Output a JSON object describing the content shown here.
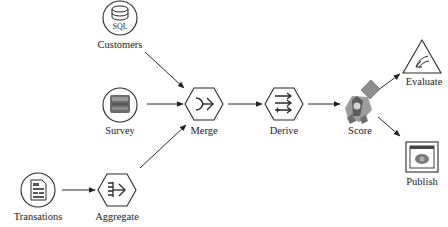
{
  "diagram": {
    "type": "data-flow",
    "nodes": [
      {
        "id": "customers",
        "label": "Customers",
        "shape": "circle",
        "icon": "database-sql-icon",
        "icon_text": "SQL"
      },
      {
        "id": "survey",
        "label": "Survey",
        "shape": "circle",
        "icon": "survey-form-icon"
      },
      {
        "id": "transations",
        "label": "Transations",
        "shape": "circle",
        "icon": "document-icon"
      },
      {
        "id": "aggregate",
        "label": "Aggregate",
        "shape": "hexagon",
        "icon": "aggregate-arrows-icon"
      },
      {
        "id": "merge",
        "label": "Merge",
        "shape": "hexagon",
        "icon": "merge-arrow-icon"
      },
      {
        "id": "derive",
        "label": "Derive",
        "shape": "hexagon",
        "icon": "derive-arrows-icon"
      },
      {
        "id": "score",
        "label": "Score",
        "shape": "diamond",
        "icon": "model-nugget-icon"
      },
      {
        "id": "evaluate",
        "label": "Evaluate",
        "shape": "triangle",
        "icon": "evaluate-chart-icon"
      },
      {
        "id": "publish",
        "label": "Publish",
        "shape": "square",
        "icon": "publish-window-icon"
      }
    ],
    "edges": [
      {
        "from": "customers",
        "to": "merge"
      },
      {
        "from": "survey",
        "to": "merge"
      },
      {
        "from": "aggregate",
        "to": "merge"
      },
      {
        "from": "transations",
        "to": "aggregate"
      },
      {
        "from": "merge",
        "to": "derive"
      },
      {
        "from": "derive",
        "to": "score"
      },
      {
        "from": "score",
        "to": "evaluate"
      },
      {
        "from": "score",
        "to": "publish"
      }
    ],
    "colors": {
      "stroke": "#2a2a2a",
      "icon_fill": "#707070",
      "score_fill": "#8a8a8a"
    }
  },
  "labels": {
    "customers": "Customers",
    "customers_icon_text": "SQL",
    "survey": "Survey",
    "transations": "Transations",
    "aggregate": "Aggregate",
    "merge": "Merge",
    "derive": "Derive",
    "score": "Score",
    "evaluate": "Evaluate",
    "publish": "Publish"
  }
}
